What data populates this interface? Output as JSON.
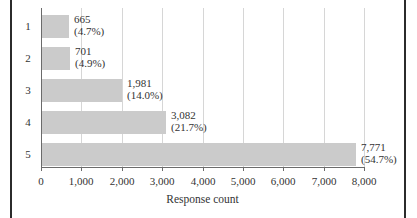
{
  "chart_data": {
    "type": "bar",
    "orientation": "horizontal",
    "xlabel": "Response count",
    "categories": [
      "1",
      "2",
      "3",
      "4",
      "5"
    ],
    "values": [
      665,
      701,
      1981,
      3082,
      7771
    ],
    "value_labels": [
      "665",
      "701",
      "1,981",
      "3,082",
      "7,771"
    ],
    "pct_labels": [
      "(4.7%)",
      "(4.9%)",
      "(14.0%)",
      "(21.7%)",
      "(54.7%)"
    ],
    "xlim": [
      0,
      8000
    ],
    "xticks": [
      0,
      1000,
      2000,
      3000,
      4000,
      5000,
      6000,
      7000,
      8000
    ],
    "xtick_labels": [
      "0",
      "1,000",
      "2,000",
      "3,000",
      "4,000",
      "5,000",
      "6,000",
      "7,000",
      "8,000"
    ],
    "grid": true,
    "legend": "none",
    "colors": {
      "bar": "#cbcbcb",
      "gridline": "#d6d6d6",
      "axis": "#6b6b6b",
      "text": "#333333",
      "frame_border": "#2b2b2b",
      "background": "#ffffff"
    }
  }
}
